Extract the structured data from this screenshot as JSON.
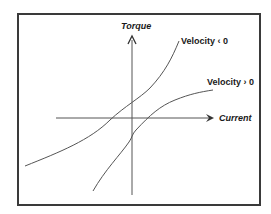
{
  "diagram": {
    "axes": {
      "y_label": "Torque",
      "x_label": "Current"
    },
    "curves": [
      {
        "label": "Velocity < 0",
        "label_text": "Velocity ‹ 0"
      },
      {
        "label": "Velocity > 0",
        "label_text": "Velocity › 0"
      }
    ],
    "colors": {
      "line": "#555555",
      "frame": "#3a3a3a",
      "text": "#1a1a1a"
    }
  }
}
